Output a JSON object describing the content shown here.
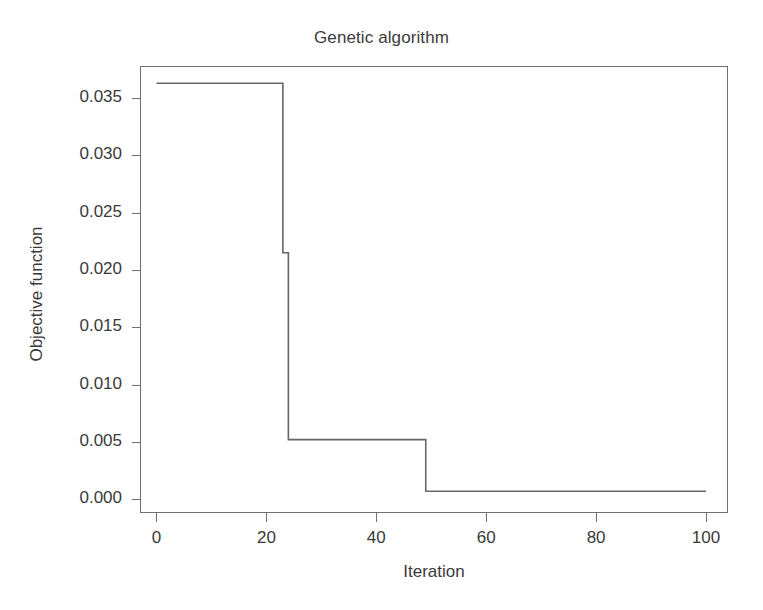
{
  "chart_data": {
    "type": "line",
    "title": "Genetic algorithm",
    "xlabel": "Iteration",
    "ylabel": "Objective function",
    "xlim": [
      -3,
      104
    ],
    "ylim": [
      -0.0012,
      0.0378
    ],
    "xticks": [
      0,
      20,
      40,
      60,
      80,
      100
    ],
    "xtick_labels": [
      "0",
      "20",
      "40",
      "60",
      "80",
      "100"
    ],
    "yticks": [
      0.0,
      0.005,
      0.01,
      0.015,
      0.02,
      0.025,
      0.03,
      0.035
    ],
    "ytick_labels": [
      "0.000",
      "0.005",
      "0.010",
      "0.015",
      "0.020",
      "0.025",
      "0.030",
      "0.035"
    ],
    "grid": false,
    "legend": false,
    "drawstyle": "steps-post",
    "line_color": "#666666",
    "line_width": 1.6,
    "series": [
      {
        "name": "Objective function",
        "x": [
          0,
          22,
          23,
          24,
          48,
          49,
          100
        ],
        "values": [
          0.0363,
          0.0363,
          0.0215,
          0.0052,
          0.0052,
          0.0007,
          0.0007
        ]
      }
    ],
    "annotations": []
  },
  "figure": {
    "background_color": "#ffffff",
    "axis_color": "#707070",
    "text_color": "#3a3a3a"
  }
}
